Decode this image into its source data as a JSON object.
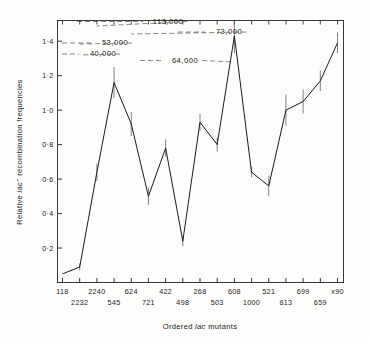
{
  "figure": {
    "xlabel_pre": "Ordered ",
    "xlabel_ital": "lac",
    "xlabel_post": " mutants",
    "ylabel_pre": "Relative ",
    "ylabel_ital": "lac",
    "ylabel_sup": "+",
    "ylabel_post": " recombination frequencies"
  },
  "chart_data": {
    "type": "line",
    "title": "",
    "xlabel": "Ordered lac mutants",
    "ylabel": "Relative lac+ recombination frequencies",
    "ylim": [
      0.0,
      1.52
    ],
    "yticks": [
      0.2,
      0.4,
      0.6,
      0.8,
      1.0,
      1.2,
      1.4
    ],
    "ytick_labels": [
      "0·2",
      "0·4",
      "0·6",
      "0·8",
      "1·0",
      "1·2",
      "1·4"
    ],
    "grid": false,
    "legend": null,
    "categories": [
      "118",
      "2232",
      "2240",
      "545",
      "624",
      "721",
      "422",
      "498",
      "268",
      "503",
      "608",
      "1000",
      "521",
      "813",
      "699",
      "659",
      "x90"
    ],
    "xtick_labels_upper": [
      "118",
      "2240",
      "624",
      "422",
      "268",
      "608",
      "521",
      "699",
      "x90"
    ],
    "xtick_labels_lower": [
      "2232",
      "545",
      "721",
      "498",
      "503",
      "1000",
      "813",
      "659"
    ],
    "values": [
      0.05,
      0.09,
      0.64,
      1.16,
      0.92,
      0.5,
      0.78,
      0.24,
      0.93,
      0.8,
      1.43,
      0.64,
      0.56,
      1.0,
      1.05,
      1.17,
      1.39
    ],
    "errors": [
      0.0,
      0.02,
      0.05,
      0.09,
      0.07,
      0.05,
      0.05,
      0.03,
      0.05,
      0.04,
      0.1,
      0.03,
      0.06,
      0.09,
      0.07,
      0.06,
      0.06
    ],
    "annotations": [
      {
        "label": "113,000",
        "target_index": 2
      },
      {
        "label": "73,000",
        "target_index": 4
      },
      {
        "label": "53,000",
        "target_index": 1
      },
      {
        "label": "40,000",
        "target_index": 1
      },
      {
        "label": "64,000",
        "target_index": 10
      }
    ]
  }
}
